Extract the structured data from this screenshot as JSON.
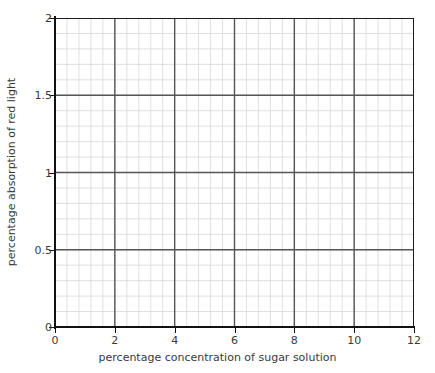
{
  "chart_data": {
    "type": "line",
    "title": "",
    "subtitle": "",
    "xlabel": "percentage concentration of sugar solution",
    "ylabel": "percentage absorption of red light",
    "xlim": [
      0,
      12
    ],
    "ylim": [
      0,
      2
    ],
    "x_major_ticks": [
      0,
      2,
      4,
      6,
      8,
      10,
      12
    ],
    "y_major_ticks": [
      0,
      0.5,
      1,
      1.5,
      2
    ],
    "x_tick_labels": [
      "0",
      "2",
      "4",
      "6",
      "8",
      "10",
      "12"
    ],
    "y_tick_labels": [
      "0",
      "0.5",
      "1",
      "1.5",
      "2"
    ],
    "x_minor_step": 0.4,
    "y_minor_step": 0.1,
    "grid": true,
    "grid_major": true,
    "grid_minor": true,
    "legend": false,
    "legend_position": "none",
    "series": [],
    "x": [],
    "values": [],
    "annotations": [],
    "note": "Blank grid; no data plotted"
  },
  "style": {
    "background": "#ffffff",
    "axis_color": "#111111",
    "major_grid_color": "#555555",
    "minor_grid_color": "#d8d8d8",
    "text_color": "#3a3a3a"
  }
}
